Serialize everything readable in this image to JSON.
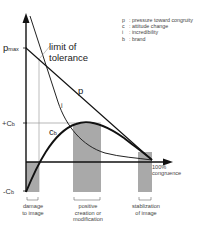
{
  "diagram": {
    "y_axis": {
      "ticks": {
        "p_max": "p",
        "p_max_sub": "max",
        "plus_cb": "+C",
        "plus_cb_sub": "b",
        "minus_cb": "-C",
        "minus_cb_sub": "b"
      }
    },
    "x_axis": {
      "end_label_line1": "100%",
      "end_label_line2": "congruence"
    },
    "annotations": {
      "limit_line1": "limit of",
      "limit_line2": "tolerance",
      "curve_p": "p",
      "curve_i": "i",
      "curve_c": "c",
      "curve_c_sub": "b"
    },
    "legend": [
      {
        "key": "p",
        "desc": ": pressure toward congruity"
      },
      {
        "key": "c",
        "desc": ": attitude change"
      },
      {
        "key": "i",
        "desc": ": incredibility"
      },
      {
        "key": "b",
        "desc": ": brand"
      }
    ],
    "zones": [
      {
        "line1": "damage",
        "line2": "to image",
        "line3": ""
      },
      {
        "line1": "positive",
        "line2": "creation or",
        "line3": "modification"
      },
      {
        "line1": "stablization",
        "line2": "of image",
        "line3": ""
      }
    ],
    "colors": {
      "shade": "#a8a8a8",
      "line": "#111111",
      "thin": "#888888"
    }
  }
}
